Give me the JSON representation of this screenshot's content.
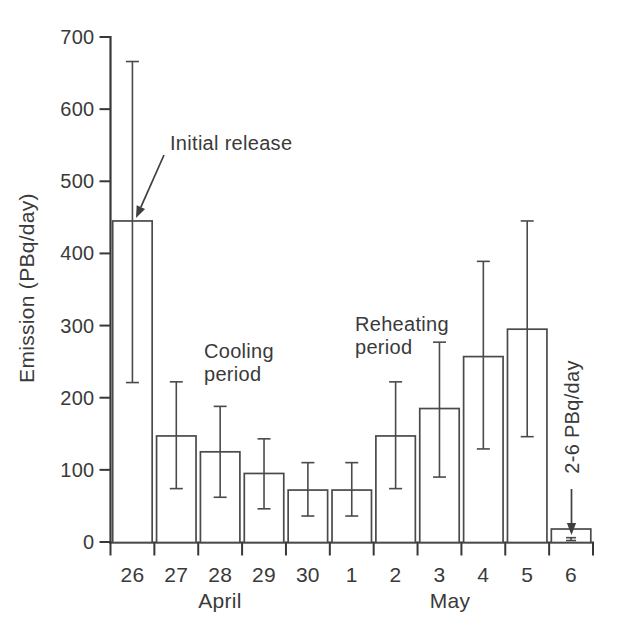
{
  "figure": {
    "kind": "printed scientific figure (scan)",
    "background": "#ffffff"
  },
  "colors": {
    "ink": "#3f3f3f",
    "axis": "#383838",
    "bar_stroke": "#4a4a4a",
    "bar_fill": "#ffffff",
    "text": "#3a3a3a"
  },
  "chart_data": {
    "type": "bar",
    "title": "",
    "xlabel": "",
    "ylabel": "Emission (PBq/day)",
    "ylim": [
      0,
      700
    ],
    "yticks": [
      0,
      100,
      200,
      300,
      400,
      500,
      600,
      700
    ],
    "grid": false,
    "legend": "none",
    "categories": [
      "Apr 26",
      "Apr 27",
      "Apr 28",
      "Apr 29",
      "Apr 30",
      "May 1",
      "May 2",
      "May 3",
      "May 4",
      "May 5",
      "May 6"
    ],
    "tick_labels": [
      "26",
      "27",
      "28",
      "29",
      "30",
      "1",
      "2",
      "3",
      "4",
      "5",
      "6"
    ],
    "month_groups": [
      {
        "label": "April",
        "days": [
          "26",
          "27",
          "28",
          "29",
          "30"
        ]
      },
      {
        "label": "May",
        "days": [
          "1",
          "2",
          "3",
          "4",
          "5",
          "6"
        ]
      }
    ],
    "values": [
      445,
      147,
      125,
      95,
      72,
      72,
      147,
      185,
      257,
      295,
      18
    ],
    "error_low": [
      221,
      74,
      62,
      46,
      36,
      36,
      74,
      90,
      129,
      146,
      2
    ],
    "error_high": [
      666,
      222,
      188,
      143,
      110,
      110,
      222,
      277,
      389,
      445,
      6
    ],
    "bars_filled": false,
    "annotations": [
      {
        "id": "initial-release",
        "text": "Initial release",
        "lines": [
          "Initial release"
        ],
        "target": "Apr 26",
        "arrow": true,
        "rotated": false
      },
      {
        "id": "cooling-period",
        "text": "Cooling period",
        "lines": [
          "Cooling",
          "period"
        ],
        "target": "",
        "arrow": false,
        "rotated": false
      },
      {
        "id": "reheating-period",
        "text": "Reheating period",
        "lines": [
          "Reheating",
          "period"
        ],
        "target": "",
        "arrow": false,
        "rotated": false
      },
      {
        "id": "may6-note",
        "text": "2-6 PBq/day",
        "lines": [
          "2-6 PBq/day"
        ],
        "target": "May 6",
        "arrow": true,
        "rotated": true
      }
    ]
  }
}
